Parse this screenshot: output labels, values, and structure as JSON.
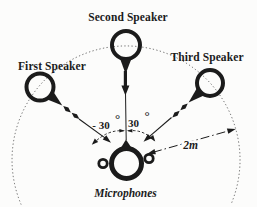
{
  "background_color": "#fcfcfb",
  "ink_color": "#1b1b1b",
  "labels": {
    "second_speaker": "Second Speaker",
    "first_speaker": "First Speaker",
    "third_speaker": "Third Speaker",
    "microphones": "Microphones",
    "angle_left": "- 30",
    "angle_left_unit": "°",
    "angle_right": "30",
    "angle_right_unit": "°",
    "distance": "2m"
  },
  "measurements": {
    "angle_left_deg": -30,
    "angle_right_deg": 30,
    "distance_to_arc": "2m"
  }
}
